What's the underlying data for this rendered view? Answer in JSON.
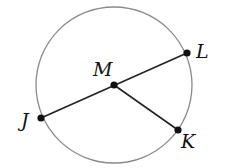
{
  "diagram": {
    "type": "circle-geometry",
    "circle": {
      "center": "M",
      "stroke": "#8a8a8a"
    },
    "points": [
      {
        "name": "M",
        "label": "M",
        "x": 114,
        "y": 85,
        "label_x": 93,
        "label_y": 76
      },
      {
        "name": "L",
        "label": "L",
        "x": 187,
        "y": 53,
        "label_x": 196,
        "label_y": 58
      },
      {
        "name": "J",
        "label": "J",
        "x": 41,
        "y": 118,
        "label_x": 21,
        "label_y": 127
      },
      {
        "name": "K",
        "label": "K",
        "x": 178,
        "y": 130,
        "label_x": 181,
        "label_y": 148
      }
    ],
    "segments": [
      "JL",
      "MK"
    ],
    "labels": {
      "M": "M",
      "L": "L",
      "J": "J",
      "K": "K"
    }
  }
}
